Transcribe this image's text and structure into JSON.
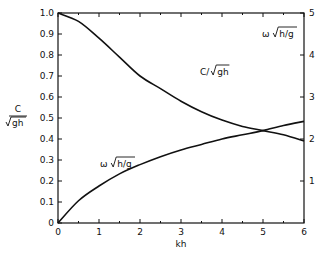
{
  "chart_data": {
    "type": "line",
    "title": "",
    "xlabel": "kh",
    "ylabel": "C/√gh",
    "ylabel_right": "ω √h/g",
    "xlim": [
      0,
      6
    ],
    "ylim": [
      0,
      1.0
    ],
    "ylim_right": [
      0,
      5
    ],
    "x_ticks": [
      "0",
      "1",
      "2",
      "3",
      "4",
      "5",
      "6"
    ],
    "y_ticks": [
      "0",
      "0.1",
      "0.2",
      "0.3",
      "0.4",
      "0.5",
      "0.6",
      "0.7",
      "0.8",
      "0.9",
      "1.0"
    ],
    "y_ticks_right": [
      "1",
      "2",
      "3",
      "4",
      "5"
    ],
    "grid": false,
    "series": [
      {
        "name": "C/√gh",
        "axis": "left",
        "x": [
          0,
          0.5,
          1,
          1.5,
          2,
          2.5,
          3,
          3.5,
          4,
          4.5,
          5,
          5.5,
          6
        ],
        "values": [
          1.0,
          0.96,
          0.88,
          0.79,
          0.7,
          0.64,
          0.58,
          0.53,
          0.49,
          0.46,
          0.44,
          0.42,
          0.39
        ]
      },
      {
        "name": "ω √h/g",
        "axis": "right",
        "x": [
          0,
          0.5,
          1,
          1.5,
          2,
          2.5,
          3,
          3.5,
          4,
          4.5,
          5,
          5.5,
          6
        ],
        "values": [
          0,
          0.53,
          0.88,
          1.17,
          1.39,
          1.58,
          1.74,
          1.87,
          2.0,
          2.1,
          2.2,
          2.32,
          2.42
        ]
      }
    ],
    "annotations": [
      {
        "text": "C/√gh",
        "near_x": 2.2
      },
      {
        "text": "ω √h/g",
        "near_x": 1.5
      },
      {
        "text": "ω √h/g",
        "position": "top-right"
      }
    ]
  },
  "labels": {
    "xlabel": "kh",
    "ylabel_num": "C",
    "ylabel_den": "gh",
    "curve1": "C/",
    "curve1_rad": "gh",
    "curve2": "ω ",
    "curve2_rad": "h/g",
    "right_axis": "ω ",
    "right_axis_rad": "h/g"
  }
}
